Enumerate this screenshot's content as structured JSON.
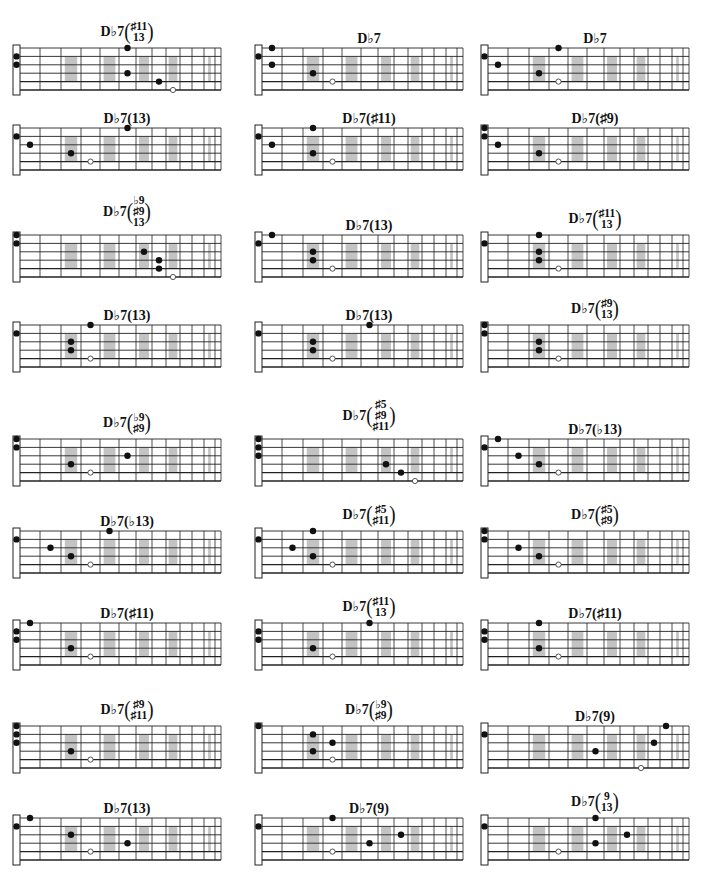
{
  "page": {
    "columns_x": [
      12,
      254,
      480
    ],
    "rows_y": [
      6,
      113,
      196,
      310,
      398,
      508,
      608,
      703,
      803
    ],
    "board_offset_y": [
      42,
      15,
      39,
      15,
      41,
      23,
      15,
      23,
      15
    ]
  },
  "fretboard": {
    "strings": 6,
    "string_spacing": 8.4,
    "nut_width": 7,
    "fret_positions": [
      0,
      20,
      41,
      61,
      80,
      99,
      116,
      132,
      146,
      160,
      172,
      184,
      195,
      201
    ],
    "marker_slots": [
      3,
      5,
      7,
      9,
      12
    ],
    "marker_color": "#b8b8b8",
    "line_color": "#222222"
  },
  "diagrams": [
    {
      "root": "D♭7",
      "ext": [
        "♯11",
        "13"
      ],
      "nut": [
        2,
        3
      ],
      "dots": [
        [
          1,
          6
        ],
        [
          4,
          6
        ],
        [
          5,
          8
        ]
      ],
      "open": [
        [
          6,
          9
        ]
      ]
    },
    {
      "root": "D♭7",
      "ext": [],
      "nut": [
        2
      ],
      "dots": [
        [
          1,
          1
        ],
        [
          3,
          1
        ],
        [
          4,
          3
        ]
      ],
      "open": [
        [
          5,
          4
        ]
      ]
    },
    {
      "root": "D♭7",
      "ext": [],
      "nut": [
        2
      ],
      "dots": [
        [
          1,
          4
        ],
        [
          3,
          1
        ],
        [
          4,
          3
        ]
      ],
      "open": [
        [
          5,
          4
        ]
      ]
    },
    {
      "root": "D♭7",
      "ext": [
        "13"
      ],
      "nut": [
        2
      ],
      "dots": [
        [
          1,
          6
        ],
        [
          3,
          1
        ],
        [
          4,
          3
        ]
      ],
      "open": [
        [
          5,
          4
        ]
      ]
    },
    {
      "root": "D♭7",
      "ext": [
        "♯11"
      ],
      "nut": [
        2
      ],
      "dots": [
        [
          1,
          3
        ],
        [
          3,
          1
        ],
        [
          4,
          3
        ]
      ],
      "open": [
        [
          5,
          4
        ]
      ]
    },
    {
      "root": "D♭7",
      "ext": [
        "♯9"
      ],
      "nut": [
        1,
        2
      ],
      "dots": [
        [
          3,
          1
        ],
        [
          4,
          3
        ]
      ],
      "open": [
        [
          5,
          4
        ]
      ]
    },
    {
      "root": "D♭7",
      "ext": [
        "♭9",
        "♯9",
        "13"
      ],
      "nut": [
        1,
        2
      ],
      "dots": [
        [
          3,
          7
        ],
        [
          4,
          8
        ],
        [
          5,
          8
        ]
      ],
      "open": [
        [
          6,
          9
        ]
      ]
    },
    {
      "root": "D♭7",
      "ext": [
        "13"
      ],
      "nut": [
        2
      ],
      "dots": [
        [
          1,
          1
        ],
        [
          3,
          3
        ],
        [
          4,
          3
        ]
      ],
      "open": [
        [
          5,
          4
        ]
      ]
    },
    {
      "root": "D♭7",
      "ext": [
        "♯11",
        "13"
      ],
      "nut": [
        2
      ],
      "dots": [
        [
          1,
          3
        ],
        [
          3,
          3
        ],
        [
          4,
          3
        ]
      ],
      "open": [
        [
          5,
          4
        ]
      ]
    },
    {
      "root": "D♭7",
      "ext": [
        "13"
      ],
      "nut": [
        2
      ],
      "dots": [
        [
          1,
          4
        ],
        [
          3,
          3
        ],
        [
          4,
          3
        ]
      ],
      "open": [
        [
          5,
          4
        ]
      ]
    },
    {
      "root": "D♭7",
      "ext": [
        "13"
      ],
      "nut": [
        2
      ],
      "dots": [
        [
          1,
          6
        ],
        [
          3,
          3
        ],
        [
          4,
          3
        ]
      ],
      "open": [
        [
          5,
          4
        ]
      ]
    },
    {
      "root": "D♭7",
      "ext": [
        "♯9",
        "13"
      ],
      "nut": [
        1,
        2
      ],
      "dots": [
        [
          3,
          3
        ],
        [
          4,
          3
        ]
      ],
      "open": [
        [
          5,
          4
        ]
      ]
    },
    {
      "root": "D♭7",
      "ext": [
        "♭9",
        "♯9"
      ],
      "nut": [
        1,
        2
      ],
      "dots": [
        [
          3,
          6
        ],
        [
          4,
          3
        ]
      ],
      "open": [
        [
          5,
          4
        ]
      ]
    },
    {
      "root": "D♭7",
      "ext": [
        "♯5",
        "♯9",
        "♯11"
      ],
      "nut": [
        1,
        2,
        3
      ],
      "dots": [
        [
          4,
          7
        ],
        [
          5,
          8
        ]
      ],
      "open": [
        [
          6,
          9
        ]
      ]
    },
    {
      "root": "D♭7",
      "ext": [
        "♭13"
      ],
      "nut": [
        2
      ],
      "dots": [
        [
          1,
          1
        ],
        [
          3,
          2
        ],
        [
          4,
          3
        ]
      ],
      "open": [
        [
          5,
          4
        ]
      ]
    },
    {
      "root": "D♭7",
      "ext": [
        "♭13"
      ],
      "nut": [
        2
      ],
      "dots": [
        [
          1,
          5
        ],
        [
          3,
          2
        ],
        [
          4,
          3
        ]
      ],
      "open": [
        [
          5,
          4
        ]
      ]
    },
    {
      "root": "D♭7",
      "ext": [
        "♯5",
        "♯11"
      ],
      "nut": [
        2
      ],
      "dots": [
        [
          1,
          3
        ],
        [
          3,
          2
        ],
        [
          4,
          3
        ]
      ],
      "open": [
        [
          5,
          4
        ]
      ]
    },
    {
      "root": "D♭7",
      "ext": [
        "♯5",
        "♯9"
      ],
      "nut": [
        1,
        2
      ],
      "dots": [
        [
          3,
          2
        ],
        [
          4,
          3
        ]
      ],
      "open": [
        [
          5,
          4
        ]
      ]
    },
    {
      "root": "D♭7",
      "ext": [
        "♯11"
      ],
      "nut": [
        2,
        3
      ],
      "dots": [
        [
          1,
          1
        ],
        [
          4,
          3
        ]
      ],
      "open": [
        [
          5,
          4
        ]
      ]
    },
    {
      "root": "D♭7",
      "ext": [
        "♯11",
        "13"
      ],
      "nut": [
        2,
        3
      ],
      "dots": [
        [
          1,
          6
        ],
        [
          4,
          3
        ]
      ],
      "open": [
        [
          5,
          4
        ]
      ]
    },
    {
      "root": "D♭7",
      "ext": [
        "♯11"
      ],
      "nut": [
        2,
        3
      ],
      "dots": [
        [
          1,
          3
        ],
        [
          4,
          3
        ]
      ],
      "open": [
        [
          5,
          4
        ]
      ]
    },
    {
      "root": "D♭7",
      "ext": [
        "♯9",
        "♯11"
      ],
      "nut": [
        1,
        2,
        3
      ],
      "dots": [
        [
          4,
          3
        ]
      ],
      "open": [
        [
          5,
          4
        ]
      ]
    },
    {
      "root": "D♭7",
      "ext": [
        "♭9",
        "♯9"
      ],
      "nut": [
        1
      ],
      "dots": [
        [
          2,
          3
        ],
        [
          3,
          4
        ],
        [
          4,
          3
        ]
      ],
      "open": [
        [
          5,
          4
        ]
      ]
    },
    {
      "root": "D♭7",
      "ext": [
        "9"
      ],
      "nut": [
        2
      ],
      "dots": [
        [
          1,
          11
        ],
        [
          3,
          10
        ],
        [
          4,
          6
        ]
      ],
      "open": [
        [
          6,
          9
        ]
      ]
    },
    {
      "root": "D♭7",
      "ext": [
        "13"
      ],
      "nut": [
        2
      ],
      "dots": [
        [
          1,
          1
        ],
        [
          3,
          3
        ],
        [
          4,
          6
        ]
      ],
      "open": [
        [
          5,
          4
        ]
      ]
    },
    {
      "root": "D♭7",
      "ext": [
        "9"
      ],
      "nut": [
        2
      ],
      "dots": [
        [
          1,
          4
        ],
        [
          3,
          8
        ],
        [
          4,
          6
        ]
      ],
      "open": [
        [
          5,
          4
        ]
      ]
    },
    {
      "root": "D♭7",
      "ext": [
        "9",
        "13"
      ],
      "nut": [
        2
      ],
      "dots": [
        [
          1,
          6
        ],
        [
          3,
          8
        ],
        [
          4,
          6
        ]
      ],
      "open": [
        [
          5,
          4
        ]
      ]
    }
  ]
}
